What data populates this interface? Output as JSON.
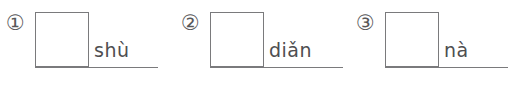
{
  "worksheet": {
    "type": "pinyin-character-writing-practice",
    "background_color": "#ffffff",
    "line_color": "#7a7a7c",
    "text_color": "#4e4e50",
    "items": [
      {
        "number": "①",
        "number_value": "1",
        "pinyin": "shù",
        "box_label": "",
        "baseline_width": "123"
      },
      {
        "number": "②",
        "number_value": "2",
        "pinyin": "diǎn",
        "box_label": "",
        "baseline_width": "133"
      },
      {
        "number": "③",
        "number_value": "3",
        "pinyin": "nà",
        "box_label": "",
        "baseline_width": "123"
      }
    ]
  }
}
